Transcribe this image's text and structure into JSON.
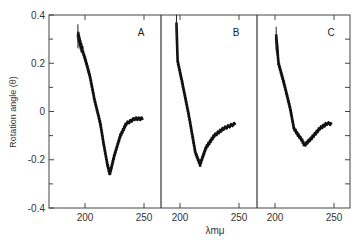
{
  "chart_data": {
    "type": "line",
    "title": "",
    "ylabel": "Rotation angle (θ)",
    "xlabel": "λmμ",
    "ylim": [
      -0.4,
      0.4
    ],
    "y_ticks": [
      0.4,
      0.2,
      0,
      -0.2,
      -0.4
    ],
    "y_tick_labels": [
      "0.4",
      "0.2",
      "0",
      "-0.2",
      "-0.4"
    ],
    "grid": false,
    "legend": null,
    "panels": [
      {
        "label": "A",
        "xlim": [
          188,
          262
        ],
        "x_ticks": [
          200,
          250
        ],
        "x_tick_labels": [
          "200",
          "250"
        ],
        "series": [
          {
            "name": "A",
            "x": [
              194,
              196,
              200,
              204,
              208,
              213,
              216,
              219,
              221,
              225,
              230,
              235,
              242,
              249
            ],
            "values": [
              0.32,
              0.28,
              0.22,
              0.15,
              0.05,
              -0.05,
              -0.14,
              -0.22,
              -0.26,
              -0.18,
              -0.1,
              -0.05,
              -0.03,
              -0.03
            ]
          }
        ]
      },
      {
        "label": "B",
        "xlim": [
          184,
          262
        ],
        "x_ticks": [
          200,
          250
        ],
        "x_tick_labels": [
          "200",
          "250"
        ],
        "series": [
          {
            "name": "B",
            "x": [
              197,
              198,
              201,
              204,
              208,
              213,
              217,
              222,
              229,
              237,
              247
            ],
            "values": [
              0.36,
              0.21,
              0.14,
              0.07,
              -0.03,
              -0.17,
              -0.22,
              -0.15,
              -0.1,
              -0.07,
              -0.05
            ]
          }
        ]
      },
      {
        "label": "C",
        "xlim": [
          185,
          263
        ],
        "x_ticks": [
          200,
          250
        ],
        "x_tick_labels": [
          "200",
          "250"
        ],
        "series": [
          {
            "name": "C",
            "x": [
              201,
              203,
              208,
              213,
              216,
              220,
              223,
              225,
              231,
              238,
              244,
              248
            ],
            "values": [
              0.31,
              0.2,
              0.11,
              0.01,
              -0.07,
              -0.1,
              -0.12,
              -0.14,
              -0.11,
              -0.07,
              -0.05,
              -0.05
            ]
          }
        ]
      }
    ]
  }
}
